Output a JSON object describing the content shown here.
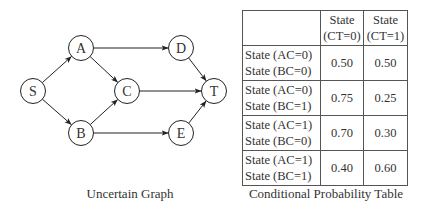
{
  "graph": {
    "caption": "Uncertain Graph",
    "nodes": [
      {
        "id": "S",
        "x": 33,
        "y": 91
      },
      {
        "id": "A",
        "x": 81,
        "y": 48
      },
      {
        "id": "B",
        "x": 81,
        "y": 133
      },
      {
        "id": "C",
        "x": 127,
        "y": 91
      },
      {
        "id": "D",
        "x": 181,
        "y": 48
      },
      {
        "id": "E",
        "x": 181,
        "y": 133
      },
      {
        "id": "T",
        "x": 214,
        "y": 91
      }
    ],
    "edges": [
      [
        "S",
        "A"
      ],
      [
        "S",
        "B"
      ],
      [
        "A",
        "C"
      ],
      [
        "A",
        "D"
      ],
      [
        "B",
        "C"
      ],
      [
        "B",
        "E"
      ],
      [
        "C",
        "T"
      ],
      [
        "D",
        "T"
      ],
      [
        "E",
        "T"
      ]
    ]
  },
  "table": {
    "caption": "Conditional Probability Table",
    "col_headers": [
      {
        "line1": "State",
        "line2": "(CT=0)"
      },
      {
        "line1": "State",
        "line2": "(CT=1)"
      }
    ],
    "rows": [
      {
        "line1": "State (AC=0)",
        "line2": "State (BC=0)",
        "values": [
          "0.50",
          "0.50"
        ]
      },
      {
        "line1": "State (AC=0)",
        "line2": "State (BC=1)",
        "values": [
          "0.75",
          "0.25"
        ]
      },
      {
        "line1": "State (AC=1)",
        "line2": "State (BC=0)",
        "values": [
          "0.70",
          "0.30"
        ]
      },
      {
        "line1": "State (AC=1)",
        "line2": "State (BC=1)",
        "values": [
          "0.40",
          "0.60"
        ]
      }
    ]
  }
}
